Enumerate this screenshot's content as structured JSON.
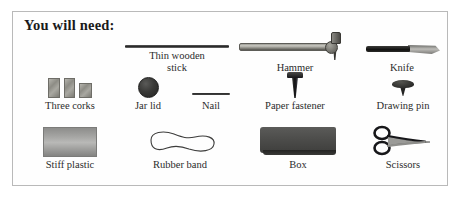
{
  "page": {
    "title": "You will need:",
    "background": "#ffffff",
    "frame_border_color": "#b9b9b9"
  },
  "items": [
    {
      "id": "thin-wooden-stick",
      "label": "Thin wooden\nstick",
      "label_line1": "Thin wooden",
      "label_line2": "stick",
      "icon": "wooden-stick-icon",
      "row": 1
    },
    {
      "id": "hammer",
      "label": "Hammer",
      "icon": "hammer-icon",
      "row": 1
    },
    {
      "id": "knife",
      "label": "Knife",
      "icon": "knife-icon",
      "row": 1
    },
    {
      "id": "three-corks",
      "label": "Three corks",
      "icon": "corks-icon",
      "row": 2
    },
    {
      "id": "jar-lid",
      "label": "Jar lid",
      "icon": "jar-lid-icon",
      "row": 2
    },
    {
      "id": "nail",
      "label": "Nail",
      "icon": "nail-icon",
      "row": 2
    },
    {
      "id": "paper-fastener",
      "label": "Paper fastener",
      "icon": "paper-fastener-icon",
      "row": 2
    },
    {
      "id": "drawing-pin",
      "label": "Drawing pin",
      "icon": "drawing-pin-icon",
      "row": 2
    },
    {
      "id": "stiff-plastic",
      "label": "Stiff plastic",
      "icon": "stiff-plastic-icon",
      "row": 3
    },
    {
      "id": "rubber-band",
      "label": "Rubber band",
      "icon": "rubber-band-icon",
      "row": 3
    },
    {
      "id": "box",
      "label": "Box",
      "icon": "box-icon",
      "row": 3
    },
    {
      "id": "scissors",
      "label": "Scissors",
      "icon": "scissors-icon",
      "row": 3
    }
  ],
  "colors": {
    "text": "#2c2c2c",
    "title": "#1a1a1a",
    "dark_object": "#232322",
    "mid_grey": "#8d8c85",
    "light_grey": "#b9b9b7"
  }
}
